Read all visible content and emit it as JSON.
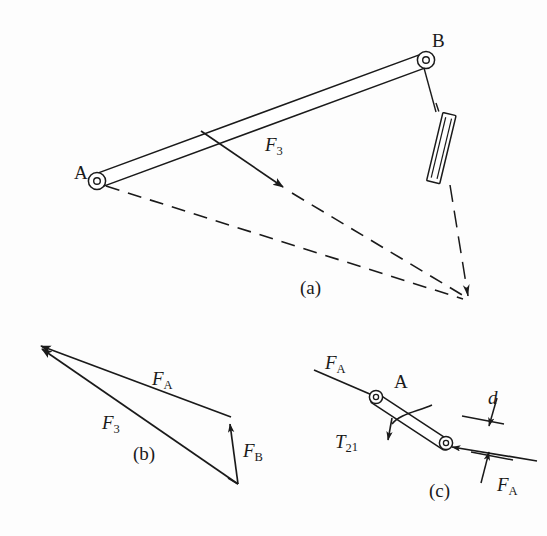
{
  "figure": {
    "type": "engineering-diagram",
    "background_color": "#fdfdfd",
    "line_color": "#1a1a1a",
    "panels": [
      {
        "id": "a",
        "caption": "(a)",
        "caption_pos": [
          300,
          288
        ],
        "content": "Slider-crank mechanism: link AB with pivots at A and B, connecting rod to slider, dashed construction lines to instant center, force F3 applied on link"
      },
      {
        "id": "b",
        "caption": "(b)",
        "caption_pos": [
          142,
          452
        ],
        "content": "Force triangle / force polygon closing F_A, F_3 and F_B"
      },
      {
        "id": "c",
        "caption": "(c)",
        "caption_pos": [
          438,
          492
        ],
        "content": "Free body diagram of link 2 with equal and opposite F_A forces, couple T21 and moment arm d"
      }
    ],
    "labels": [
      {
        "name": "point-a-label-panel-a",
        "text": "A",
        "style": "plain",
        "x": 74,
        "y": 162,
        "size": 19
      },
      {
        "name": "point-b-label-panel-a",
        "text": "B",
        "style": "plain",
        "x": 432,
        "y": 30,
        "size": 19
      },
      {
        "name": "force-f3-label-panel-a",
        "text": "F",
        "sub": "3",
        "style": "italic",
        "x": 265,
        "y": 134,
        "size": 19
      },
      {
        "name": "caption-a",
        "text": "(a)",
        "style": "plain",
        "x": 300,
        "y": 277,
        "size": 19
      },
      {
        "name": "force-fa-label-panel-b",
        "text": "F",
        "sub": "A",
        "style": "italic",
        "x": 152,
        "y": 368,
        "size": 19
      },
      {
        "name": "force-f3-label-panel-b",
        "text": "F",
        "sub": "3",
        "style": "italic",
        "x": 102,
        "y": 412,
        "size": 19
      },
      {
        "name": "force-fb-label-panel-b",
        "text": "F",
        "sub": "B",
        "style": "italic",
        "x": 243,
        "y": 440,
        "size": 19
      },
      {
        "name": "caption-b",
        "text": "(b)",
        "style": "plain",
        "x": 133,
        "y": 443,
        "size": 19
      },
      {
        "name": "force-fa-label-panel-c-upper",
        "text": "F",
        "sub": "A",
        "style": "italic",
        "x": 325,
        "y": 352,
        "size": 19
      },
      {
        "name": "point-a-label-panel-c",
        "text": "A",
        "style": "plain",
        "x": 394,
        "y": 371,
        "size": 19
      },
      {
        "name": "torque-t21-label-panel-c",
        "text": "T",
        "sub": "2",
        "sub2": "1",
        "style": "italic",
        "x": 335,
        "y": 431,
        "size": 19
      },
      {
        "name": "dimension-d-label-panel-c",
        "text": "d",
        "style": "italic",
        "x": 488,
        "y": 387,
        "size": 19
      },
      {
        "name": "force-fa-label-panel-c-lower",
        "text": "F",
        "sub": "A",
        "style": "italic",
        "x": 497,
        "y": 474,
        "size": 19
      },
      {
        "name": "caption-c",
        "text": "(c)",
        "style": "plain",
        "x": 429,
        "y": 480,
        "size": 19
      }
    ],
    "geometry": {
      "panel_a": {
        "pivot_a": [
          97,
          181
        ],
        "pivot_b": [
          426,
          60
        ],
        "link_ab_width": 14,
        "slider_center": [
          441,
          148
        ],
        "slider_angle_deg": 73,
        "instant_center": [
          468,
          300
        ],
        "f3_arrow_start": [
          201,
          131
        ],
        "f3_arrow_end": [
          287,
          190
        ],
        "dashed_from_a_to_ic": true,
        "dashed_from_f3line_to_ic": true,
        "dashdot_from_b_through_slider_to_ic": true
      },
      "panel_b": {
        "apex": [
          33,
          343
        ],
        "upper_right": [
          231,
          417
        ],
        "lower_right": [
          238,
          484
        ],
        "vectors": [
          {
            "name": "F_A",
            "from": [
              231,
              417
            ],
            "to": [
              33,
              343
            ]
          },
          {
            "name": "F_3",
            "from": [
              238,
              484
            ],
            "to": [
              34,
              345
            ]
          },
          {
            "name": "F_B",
            "from": [
              238,
              484
            ],
            "to": [
              230,
              419
            ]
          }
        ]
      },
      "panel_c": {
        "pivot_a": [
          376,
          397
        ],
        "pivot_lower": [
          446,
          443
        ],
        "link_width": 11,
        "force_line_upper_start": [
          314,
          370
        ],
        "force_line_upper_end": [
          392,
          404
        ],
        "force_line_lower_start": [
          537,
          460
        ],
        "force_line_lower_end": [
          440,
          446
        ],
        "torque_arc": true,
        "dimension_d": {
          "tick_upper": [
            478,
            420
          ],
          "tick_lower": [
            497,
            455
          ]
        }
      }
    }
  }
}
